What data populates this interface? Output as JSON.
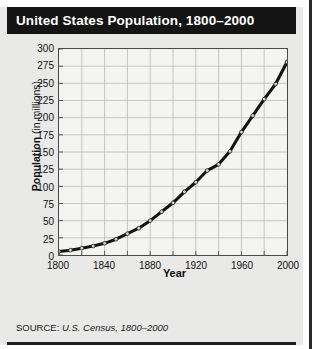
{
  "figure": {
    "title": "United States Population, 1800–2000",
    "source_label": "SOURCE: ",
    "source_value": "U.S. Census, 1800–2000",
    "colors": {
      "title_bar": "#141414",
      "title_text": "#ffffff",
      "figure_background": "#e9e9e7",
      "plot_background": "#f4f4f2",
      "axis": "#4a4a4a",
      "gridline": "#b9b9b6",
      "series_line": "#131313",
      "marker_fill": "#cfcfcc",
      "page_rule": "#2b2b2b"
    }
  },
  "chart_data": {
    "type": "line",
    "title": "United States Population, 1800–2000",
    "xlabel": "Year",
    "ylabel_strong": "Population",
    "ylabel_rest": " (in millions)",
    "ylabel": "Population (in millions)",
    "xlim": [
      1800,
      2000
    ],
    "ylim": [
      0,
      300
    ],
    "grid": true,
    "legend": "none",
    "y_ticks": [
      0,
      25,
      50,
      75,
      100,
      125,
      150,
      175,
      200,
      225,
      250,
      275,
      300
    ],
    "x_ticks": [
      1800,
      1820,
      1840,
      1860,
      1880,
      1900,
      1920,
      1940,
      1960,
      1980,
      2000
    ],
    "x_tick_labels_shown": [
      1800,
      1840,
      1880,
      1920,
      1960,
      2000
    ],
    "x": [
      1800,
      1810,
      1820,
      1830,
      1840,
      1850,
      1860,
      1870,
      1880,
      1890,
      1900,
      1910,
      1920,
      1930,
      1940,
      1950,
      1960,
      1970,
      1980,
      1990,
      2000
    ],
    "values": [
      5,
      7,
      10,
      13,
      17,
      23,
      31,
      39,
      50,
      63,
      76,
      92,
      106,
      123,
      132,
      151,
      179,
      203,
      227,
      249,
      281
    ],
    "series": [
      {
        "name": "U.S. Population",
        "values": [
          5,
          7,
          10,
          13,
          17,
          23,
          31,
          39,
          50,
          63,
          76,
          92,
          106,
          123,
          132,
          151,
          179,
          203,
          227,
          249,
          281
        ]
      }
    ]
  }
}
